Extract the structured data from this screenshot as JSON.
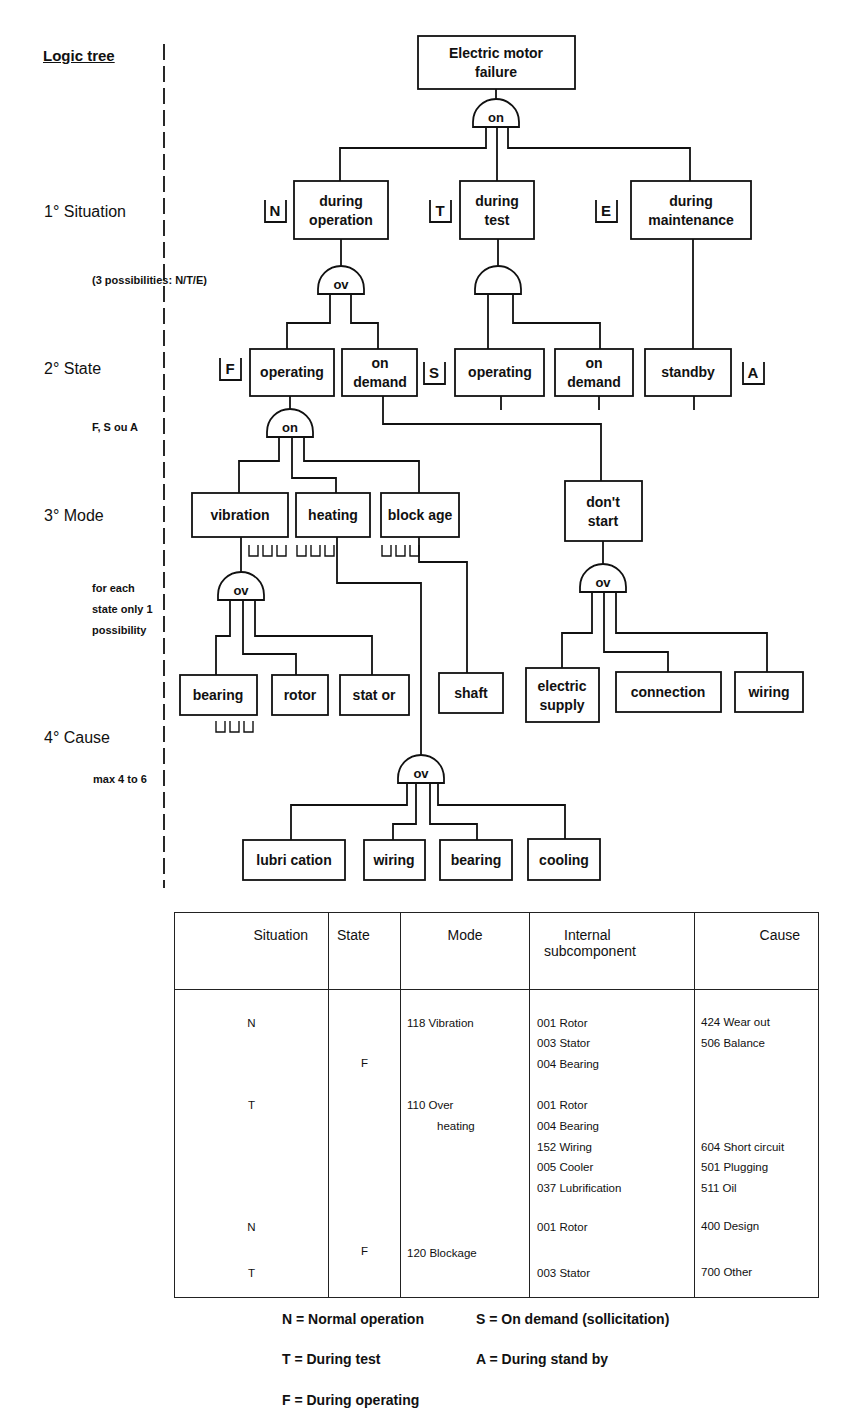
{
  "left_labels": {
    "title": "Logic tree",
    "level1": "1° Situation",
    "level1_note": "(3 possibilities: N/T/E)",
    "level2": "2° State",
    "level2_note": "F, S ou A",
    "level3": "3° Mode",
    "level3_note": [
      "for each",
      "state only 1",
      "possibility"
    ],
    "level4": "4° Cause",
    "level4_note": "max 4 to 6"
  },
  "tree": {
    "root": "Electric motor failure",
    "root_lines": [
      "Electric motor",
      "failure"
    ],
    "gates": {
      "root_gate": "on",
      "operation_gate": "ov",
      "test_gate": "",
      "operating_gate": "on",
      "vibration_gate": "ov",
      "heating_gate": "ov",
      "dontstart_gate": "ov"
    },
    "situations": [
      {
        "code": "N",
        "lines": [
          "during",
          "operation"
        ]
      },
      {
        "code": "T",
        "lines": [
          "during",
          "test"
        ]
      },
      {
        "code": "E",
        "lines": [
          "during",
          "maintenance"
        ]
      }
    ],
    "states": [
      {
        "code": "F",
        "lines": [
          "operating"
        ]
      },
      {
        "code": "S",
        "lines": [
          "on",
          "demand"
        ]
      },
      {
        "code": "",
        "lines": [
          "operating"
        ]
      },
      {
        "code": "",
        "lines": [
          "on",
          "demand"
        ]
      },
      {
        "code": "A",
        "lines": [
          "standby"
        ]
      }
    ],
    "modes": [
      {
        "lines": [
          "vibration"
        ]
      },
      {
        "lines": [
          "heating"
        ]
      },
      {
        "lines": [
          "block age"
        ]
      },
      {
        "lines": [
          "don't",
          "start"
        ]
      }
    ],
    "causes_vibration": [
      {
        "lines": [
          "bearing"
        ]
      },
      {
        "lines": [
          "rotor"
        ]
      },
      {
        "lines": [
          "stat or"
        ]
      }
    ],
    "causes_blockage": [
      {
        "lines": [
          "shaft"
        ]
      }
    ],
    "causes_dontstart": [
      {
        "lines": [
          "electric",
          "supply"
        ]
      },
      {
        "lines": [
          "connection"
        ]
      },
      {
        "lines": [
          "wiring"
        ]
      }
    ],
    "causes_heating": [
      {
        "lines": [
          "lubri cation"
        ]
      },
      {
        "lines": [
          "wiring"
        ]
      },
      {
        "lines": [
          "bearing"
        ]
      },
      {
        "lines": [
          "cooling"
        ]
      }
    ]
  },
  "table": {
    "headers": [
      "Situation",
      "State",
      "Mode",
      "Internal\nsubcomponent",
      "Cause"
    ],
    "header_internal_lines": [
      "Internal",
      "subcomponent"
    ],
    "situation": [
      {
        "t": "N",
        "y": 34
      },
      {
        "t": "T",
        "y": 116
      },
      {
        "t": "N",
        "y": 238
      },
      {
        "t": "T",
        "y": 284
      }
    ],
    "state": [
      {
        "t": "F",
        "y": 74
      },
      {
        "t": "F",
        "y": 262
      }
    ],
    "mode": [
      {
        "t": "118 Vibration",
        "y": 34
      },
      {
        "t": "110 Over",
        "y": 116
      },
      {
        "t": "heating",
        "y": 137,
        "indent": 30
      },
      {
        "t": "120 Blockage",
        "y": 264
      }
    ],
    "subcomponent": [
      {
        "t": "001 Rotor",
        "y": 34
      },
      {
        "t": "003 Stator",
        "y": 54
      },
      {
        "t": "004 Bearing",
        "y": 75
      },
      {
        "t": "001 Rotor",
        "y": 116
      },
      {
        "t": "004 Bearing",
        "y": 137
      },
      {
        "t": "152 Wiring",
        "y": 158
      },
      {
        "t": "005 Cooler",
        "y": 178
      },
      {
        "t": "037 Lubrification",
        "y": 199
      },
      {
        "t": "001 Rotor",
        "y": 238
      },
      {
        "t": "003 Stator",
        "y": 284
      }
    ],
    "cause": [
      {
        "t": "424 Wear out",
        "y": 33
      },
      {
        "t": "506 Balance",
        "y": 54
      },
      {
        "t": "604 Short circuit",
        "y": 158
      },
      {
        "t": "501 Plugging",
        "y": 178
      },
      {
        "t": "511 Oil",
        "y": 199
      },
      {
        "t": "400 Design",
        "y": 237
      },
      {
        "t": "700 Other",
        "y": 283
      }
    ]
  },
  "legend": [
    {
      "text": "N = Normal operation",
      "x": 282,
      "y": 1327
    },
    {
      "text": "S = On demand (sollicitation)",
      "x": 476,
      "y": 1327
    },
    {
      "text": "T = During test",
      "x": 282,
      "y": 1367
    },
    {
      "text": "A = During stand by",
      "x": 476,
      "y": 1367
    },
    {
      "text": "F = During operating",
      "x": 282,
      "y": 1408
    }
  ]
}
